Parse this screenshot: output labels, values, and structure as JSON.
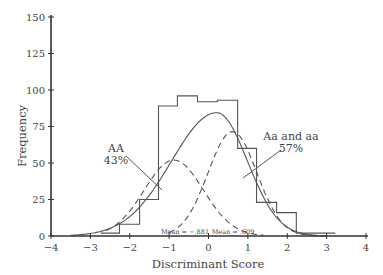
{
  "chart_data": {
    "type": "histogram_with_density_curves",
    "title": "",
    "xlabel": "Discriminant Score",
    "ylabel": "Frequency",
    "xlim": [
      -4,
      4
    ],
    "ylim": [
      0,
      150
    ],
    "x_ticks": [
      -4,
      -3,
      -2,
      -1,
      0,
      1,
      2,
      3,
      4
    ],
    "x_tick_labels": [
      "−4",
      "−3",
      "−2",
      "−1",
      "0",
      "1",
      "2",
      "3",
      "4"
    ],
    "y_ticks": [
      0,
      25,
      50,
      75,
      100,
      125,
      150
    ],
    "y_tick_labels": [
      "0",
      "25",
      "50",
      "75",
      "100",
      "125",
      "150"
    ],
    "grid": false,
    "histogram": {
      "bin_edges": [
        -2.74,
        -2.26,
        -1.75,
        -1.27,
        -0.79,
        -0.28,
        0.23,
        0.74,
        1.22,
        1.73,
        2.23,
        3.22
      ],
      "counts": [
        2,
        8,
        25,
        89,
        96,
        92,
        93,
        60,
        23,
        16,
        2
      ]
    },
    "series": [
      {
        "name": "Combined fit",
        "style": "solid",
        "mean": 0.21,
        "sd": 1.02,
        "peak": 84.5,
        "x_start": -3.5,
        "x_end": 2.8
      },
      {
        "name": "AA",
        "style": "dashed",
        "mean": -0.881,
        "sd": 0.75,
        "peak": 52,
        "x_start": -2.6,
        "x_end": 1.4
      },
      {
        "name": "Aa and aa",
        "style": "dashed",
        "mean": 0.609,
        "sd": 0.62,
        "peak": 71.5,
        "x_start": -1.0,
        "x_end": 3.0
      }
    ],
    "annotations": [
      {
        "text_lines": [
          "AA",
          "43%"
        ],
        "label_xy": [
          116,
          152
        ],
        "pointer": [
          [
            126,
            156
          ],
          [
            162,
            190
          ]
        ]
      },
      {
        "text_lines": [
          "Aa and aa",
          "57%"
        ],
        "label_xy": [
          291,
          140
        ],
        "pointer": [
          [
            281,
            150
          ],
          [
            243,
            178
          ]
        ]
      },
      {
        "text": "Mean = −.881",
        "x_px": 185,
        "y_px": 234
      },
      {
        "text": "Mean = .609",
        "x_px": 233,
        "y_px": 234
      }
    ],
    "legend": "none"
  }
}
